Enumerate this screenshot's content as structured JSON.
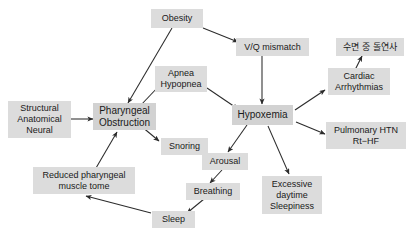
{
  "diagram": {
    "box_fill": "#dcdcdc",
    "arrow_color": "#2b2b2b",
    "background": "#ffffff",
    "nodes": [
      {
        "id": "structural",
        "lines": [
          "Structural",
          "Anatomical",
          "Neural"
        ]
      },
      {
        "id": "obesity",
        "lines": [
          "Obesity"
        ]
      },
      {
        "id": "pharyngeal_obstruction",
        "lines": [
          "Pharyngeal",
          "Obstruction"
        ]
      },
      {
        "id": "apnea_hypopnea",
        "lines": [
          "Apnea",
          "Hypopnea"
        ]
      },
      {
        "id": "snoring",
        "lines": [
          "Snoring"
        ]
      },
      {
        "id": "vq_mismatch",
        "lines": [
          "V/Q  mismatch"
        ]
      },
      {
        "id": "hypoxemia",
        "lines": [
          "Hypoxemia"
        ]
      },
      {
        "id": "cardiac_arrhythmias",
        "lines": [
          "Cardiac",
          "Arrhythmias"
        ]
      },
      {
        "id": "sudden_death_sleep",
        "lines": [
          "수면 중 돌연사"
        ]
      },
      {
        "id": "pulmonary_htn",
        "lines": [
          "Pulmonary  HTN",
          "Rt−HF"
        ]
      },
      {
        "id": "arousal",
        "lines": [
          "Arousal"
        ]
      },
      {
        "id": "excessive_daytime_sleepiness",
        "lines": [
          "Excessive",
          "daytime",
          "Sleepiness"
        ]
      },
      {
        "id": "breathing",
        "lines": [
          "Breathing"
        ]
      },
      {
        "id": "sleep",
        "lines": [
          "Sleep"
        ]
      },
      {
        "id": "reduced_muscle_tone",
        "lines": [
          "Reduced  pharyngeal",
          "muscle  tome"
        ]
      }
    ],
    "edges": [
      {
        "from": "structural",
        "to": "pharyngeal_obstruction"
      },
      {
        "from": "obesity",
        "to": "pharyngeal_obstruction"
      },
      {
        "from": "obesity",
        "to": "vq_mismatch"
      },
      {
        "from": "pharyngeal_obstruction",
        "to": "apnea_hypopnea"
      },
      {
        "from": "pharyngeal_obstruction",
        "to": "snoring"
      },
      {
        "from": "apnea_hypopnea",
        "to": "hypoxemia"
      },
      {
        "from": "vq_mismatch",
        "to": "hypoxemia"
      },
      {
        "from": "hypoxemia",
        "to": "cardiac_arrhythmias"
      },
      {
        "from": "cardiac_arrhythmias",
        "to": "sudden_death_sleep"
      },
      {
        "from": "hypoxemia",
        "to": "pulmonary_htn"
      },
      {
        "from": "hypoxemia",
        "to": "arousal"
      },
      {
        "from": "hypoxemia",
        "to": "excessive_daytime_sleepiness"
      },
      {
        "from": "arousal",
        "to": "breathing"
      },
      {
        "from": "breathing",
        "to": "sleep"
      },
      {
        "from": "sleep",
        "to": "reduced_muscle_tone"
      },
      {
        "from": "reduced_muscle_tone",
        "to": "pharyngeal_obstruction"
      }
    ]
  }
}
